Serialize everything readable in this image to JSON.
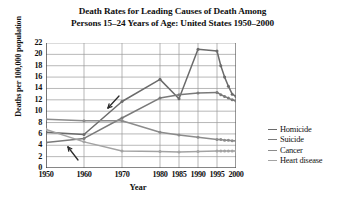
{
  "chart_data": {
    "type": "line",
    "title": "Death Rates for Leading Causes of Death Among Persons 15–24 Years of Age: United States 1950–2000",
    "title_line1": "Death Rates for Leading Causes of Death Among",
    "title_line2": "Persons 15–24 Years of Age: United States 1950–2000",
    "xlabel": "Year",
    "ylabel": "Deaths per 100,000 population",
    "grid": true,
    "legend_position": "right",
    "ylim": [
      0,
      22
    ],
    "yticks": [
      "0",
      "2",
      "4",
      "6",
      "8",
      "10",
      "12",
      "14",
      "16",
      "18",
      "20",
      "22"
    ],
    "xticks": [
      "1950",
      "1960",
      "1970",
      "1980",
      "1985",
      "1990",
      "1995",
      "2000"
    ],
    "x": [
      1950,
      1960,
      1970,
      1980,
      1985,
      1990,
      1995,
      1996,
      1997,
      1998,
      1999,
      2000
    ],
    "series": [
      {
        "name": "Homicide",
        "color": "#6b6b6b",
        "values": [
          6.3,
          5.9,
          11.7,
          15.6,
          12.2,
          20.9,
          20.6,
          18.0,
          16.0,
          14.4,
          13.0,
          12.6
        ]
      },
      {
        "name": "Suicide",
        "color": "#7a7a7a",
        "values": [
          4.5,
          5.2,
          8.8,
          12.3,
          12.9,
          13.2,
          13.3,
          12.9,
          12.6,
          12.3,
          12.0,
          11.8
        ]
      },
      {
        "name": "Cancer",
        "color": "#8c8c8c",
        "values": [
          8.6,
          8.3,
          8.3,
          6.3,
          5.8,
          5.4,
          5.0,
          5.0,
          4.9,
          4.9,
          4.8,
          4.8
        ]
      },
      {
        "name": "Heart disease",
        "color": "#a3a3a3",
        "values": [
          6.8,
          4.6,
          3.0,
          2.9,
          2.8,
          2.9,
          3.0,
          3.0,
          3.0,
          3.0,
          3.0,
          3.0
        ]
      }
    ],
    "annotations": [
      {
        "name": "arrow-heart-disease-1960",
        "label": ""
      },
      {
        "name": "arrow-homicide-1975",
        "label": ""
      }
    ]
  },
  "legend": {
    "items": [
      {
        "label": "Homicide"
      },
      {
        "label": "Suicide"
      },
      {
        "label": "Cancer"
      },
      {
        "label": "Heart disease"
      }
    ]
  }
}
